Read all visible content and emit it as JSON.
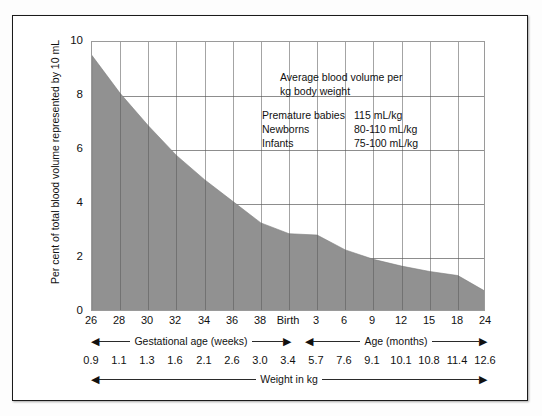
{
  "chart_data": {
    "type": "area",
    "title": "",
    "ylabel": "Per cent of total blood volume represented by 10 mL",
    "xlabel": "Weight in kg",
    "ylim": [
      0,
      10
    ],
    "yticks": [
      0,
      2,
      4,
      6,
      8,
      10
    ],
    "grid": true,
    "legend": "none",
    "x_axis_top": {
      "label_groups": [
        {
          "name": "Gestational age (weeks)",
          "from_index": 0,
          "to_index": 6
        },
        {
          "name": "Age (months)",
          "from_index": 8,
          "to_index": 13
        }
      ],
      "categories": [
        "26",
        "28",
        "30",
        "32",
        "34",
        "36",
        "38",
        "Birth",
        "3",
        "6",
        "9",
        "12",
        "15",
        "18",
        "24"
      ]
    },
    "x_axis_bottom": {
      "label": "Weight in kg",
      "values": [
        "0.9",
        "1.1",
        "1.3",
        "1.6",
        "2.1",
        "2.6",
        "3.0",
        "3.4",
        "5.7",
        "7.6",
        "9.1",
        "10.1",
        "10.8",
        "11.4",
        "12.6"
      ]
    },
    "series": [
      {
        "name": "Per cent of total blood volume represented by 10 mL",
        "fill_color": "#919191",
        "x": [
          "26",
          "28",
          "30",
          "32",
          "34",
          "36",
          "38",
          "Birth",
          "3",
          "6",
          "9",
          "12",
          "15",
          "18",
          "24"
        ],
        "values": [
          9.5,
          8.1,
          6.9,
          5.8,
          4.9,
          4.1,
          3.3,
          2.9,
          2.85,
          2.3,
          1.95,
          1.7,
          1.5,
          1.35,
          0.75
        ]
      }
    ],
    "annotation": {
      "heading_line1": "Average blood volume per",
      "heading_line2": "kg body weight",
      "rows": [
        {
          "label": "Premature babies",
          "value": "115 mL/kg"
        },
        {
          "label": "Newborns",
          "value": "80-110 mL/kg"
        },
        {
          "label": "Infants",
          "value": "75-100 mL/kg"
        }
      ]
    },
    "arrows": {
      "left_cap": "◀",
      "right_cap": "▶"
    }
  }
}
